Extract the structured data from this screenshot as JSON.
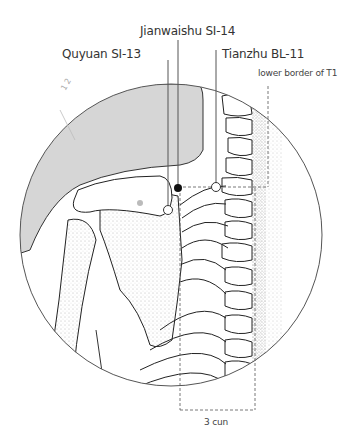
{
  "figure": {
    "type": "anatomical acupuncture point diagram",
    "region": "upper back / shoulder, posterior view"
  },
  "labels": {
    "jianwaishu": "Jianwaishu SI-14",
    "quyuan": "Quyuan SI-13",
    "tianzhu": "Tianzhu BL-11",
    "t1": "lower border of T1",
    "measure": "3 cun",
    "small_mark": "1 2"
  },
  "points": [
    {
      "name": "Jianwaishu SI-14",
      "style": "filled",
      "x": 178,
      "y": 188
    },
    {
      "name": "Quyuan SI-13",
      "style": "open",
      "x": 168,
      "y": 210
    },
    {
      "name": "Tianzhu BL-11",
      "style": "open",
      "x": 216,
      "y": 187
    }
  ],
  "colors": {
    "line": "#555555",
    "shade": "#d6d6d6",
    "point_fill": "#111111",
    "text": "#333333"
  }
}
